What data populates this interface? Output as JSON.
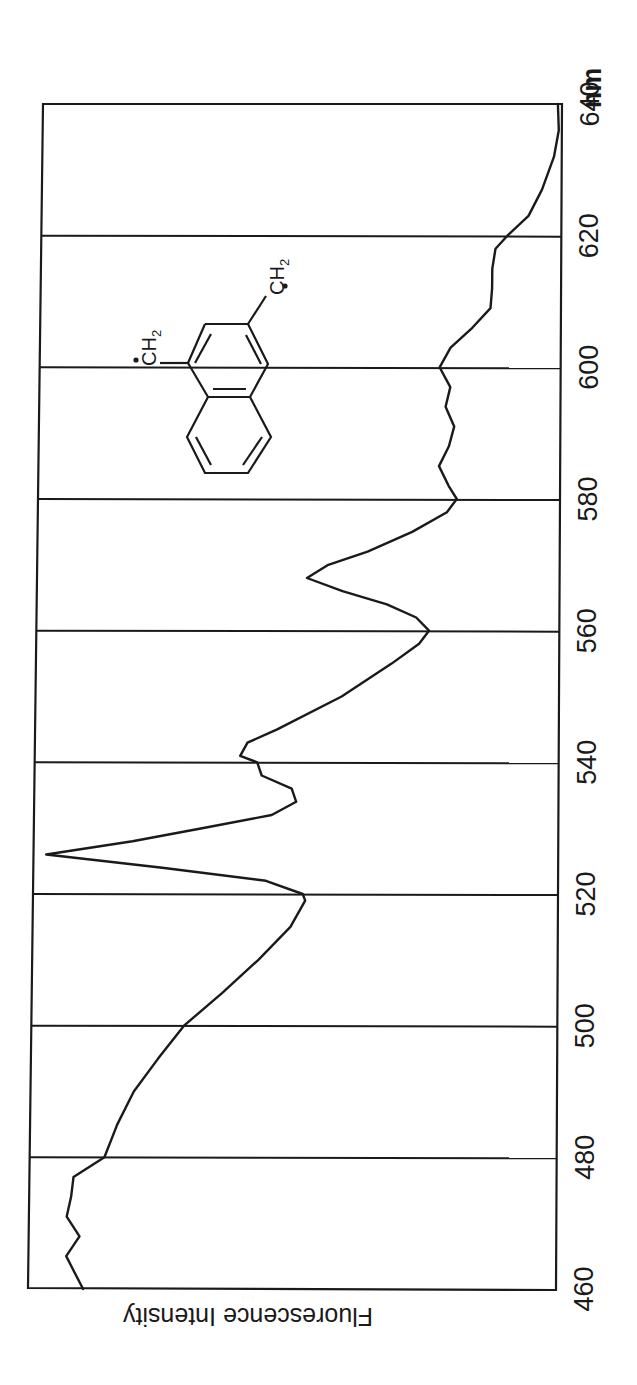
{
  "figure": {
    "orientation": "rotated 90 degrees counter-clockwise",
    "ink_color": "#1a1a1a",
    "background_color": "#ffffff"
  },
  "chart_data": {
    "type": "line",
    "title": "",
    "xlabel": "nm",
    "ylabel": "Fluorescence Intensity",
    "xlim": [
      460,
      640
    ],
    "ylim": [
      0,
      100
    ],
    "y_units": "relative (arbitrary)",
    "grid": {
      "vertical_lines_at": [
        480,
        500,
        520,
        540,
        560,
        580,
        600,
        620
      ],
      "horizontal": false
    },
    "x_ticks": [
      460,
      480,
      500,
      520,
      540,
      560,
      580,
      600,
      620,
      640
    ],
    "x_tick_labels": [
      "460",
      "480",
      "500",
      "520",
      "540",
      "560",
      "580",
      "600",
      "620",
      "640"
    ],
    "legend": null,
    "annotations": [
      {
        "type": "structure",
        "description": "1,3-naphthoquinodimethane biradical (naphthalene with two CH2• groups)",
        "labels": [
          "ĊH2",
          "ĊH2"
        ]
      }
    ],
    "series": [
      {
        "name": "fluorescence",
        "x": [
          460,
          463,
          465,
          468,
          471,
          474,
          477,
          480,
          485,
          490,
          495,
          500,
          505,
          510,
          515,
          519,
          520,
          522,
          524,
          526,
          528,
          530,
          532,
          534,
          536,
          538,
          540,
          541,
          543,
          545,
          550,
          555,
          558,
          560,
          562,
          564,
          566,
          568,
          570,
          572,
          575,
          578,
          580,
          582,
          585,
          588,
          591,
          594,
          597,
          600,
          603,
          606,
          609,
          612,
          615,
          618,
          620,
          623,
          627,
          632,
          636,
          640
        ],
        "values": [
          90.6,
          92.6,
          93.9,
          91.4,
          93.9,
          93.1,
          92.7,
          86.8,
          84.4,
          81.3,
          76.7,
          71.8,
          64.5,
          57.6,
          51.5,
          48.7,
          49.2,
          56.3,
          76.3,
          98.7,
          82.1,
          68.7,
          55.3,
          50.6,
          51.5,
          57.3,
          58.2,
          61.5,
          60.1,
          54.4,
          42.0,
          32.4,
          27.1,
          25.2,
          27.7,
          33.4,
          42.0,
          48.9,
          44.8,
          37.2,
          28.6,
          21.9,
          20.0,
          21.6,
          23.5,
          21.6,
          20.6,
          22.3,
          21.4,
          23.5,
          21.4,
          17.2,
          13.7,
          13.4,
          13.4,
          12.8,
          10.5,
          6.4,
          3.8,
          1.5,
          0.6,
          0.8
        ]
      }
    ]
  },
  "labels": {
    "unit": "nm",
    "y_axis_title": "Fluorescence Intensity",
    "ticks": [
      "460",
      "480",
      "500",
      "520",
      "540",
      "560",
      "580",
      "600",
      "620",
      "640"
    ],
    "molecule": {
      "group_left": "CH",
      "group_left_sub": "2",
      "group_right": "CH",
      "group_right_sub": "2",
      "radical_dot": "•"
    }
  }
}
